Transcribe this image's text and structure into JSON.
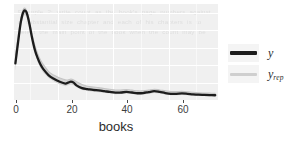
{
  "chart_data": {
    "type": "line",
    "title": "",
    "subtitle": "",
    "xlabel": "books",
    "ylabel": "",
    "xlim": [
      -0.5,
      73
    ],
    "ylim": [
      0,
      0.105
    ],
    "xticks": [
      0,
      20,
      40,
      60
    ],
    "xticklabels": [
      "0",
      "20",
      "40",
      "60"
    ],
    "yticks": [],
    "yticklabels": [],
    "grid": true,
    "grid_color": "#ffffff",
    "panel_background": "#f0f0f0",
    "legend_position": "right",
    "series": [
      {
        "name": "y",
        "label": "y",
        "color": "#1c1c1c",
        "linewidth": 2.2,
        "x": [
          0,
          1,
          2,
          3,
          4,
          5,
          6,
          7,
          8,
          9,
          10,
          12,
          14,
          16,
          18,
          19,
          20,
          21,
          22,
          24,
          26,
          28,
          30,
          32,
          34,
          36,
          38,
          40,
          42,
          44,
          46,
          48,
          50,
          52,
          54,
          56,
          58,
          60,
          62,
          64,
          66,
          68,
          70,
          72
        ],
        "values": [
          0.04,
          0.064,
          0.086,
          0.097,
          0.096,
          0.084,
          0.068,
          0.055,
          0.046,
          0.039,
          0.034,
          0.027,
          0.023,
          0.02,
          0.018,
          0.019,
          0.02,
          0.019,
          0.016,
          0.013,
          0.012,
          0.011,
          0.0105,
          0.0097,
          0.0088,
          0.008,
          0.0082,
          0.0088,
          0.0082,
          0.0074,
          0.0076,
          0.0086,
          0.0096,
          0.0088,
          0.0076,
          0.0068,
          0.0068,
          0.0072,
          0.0068,
          0.0062,
          0.0058,
          0.0056,
          0.0054,
          0.0052
        ]
      },
      {
        "name": "y_rep",
        "label": "y",
        "label_sub": "rep",
        "color": "#cfcfcf",
        "linewidth": 1.0,
        "description": "posterior predictive replications (light gray band)",
        "band_upper": [
          0.049,
          0.07,
          0.09,
          0.1,
          0.098,
          0.087,
          0.072,
          0.06,
          0.051,
          0.044,
          0.039,
          0.031,
          0.027,
          0.024,
          0.022,
          0.022,
          0.023,
          0.022,
          0.02,
          0.017,
          0.015,
          0.0142,
          0.0135,
          0.0126,
          0.0118,
          0.011,
          0.011,
          0.0114,
          0.0108,
          0.01,
          0.01,
          0.0108,
          0.0118,
          0.011,
          0.01,
          0.0092,
          0.0092,
          0.0094,
          0.009,
          0.0084,
          0.008,
          0.0077,
          0.0075,
          0.0073
        ],
        "band_lower": [
          0.032,
          0.057,
          0.081,
          0.093,
          0.092,
          0.08,
          0.064,
          0.051,
          0.042,
          0.035,
          0.03,
          0.024,
          0.02,
          0.017,
          0.015,
          0.016,
          0.017,
          0.016,
          0.014,
          0.011,
          0.0098,
          0.009,
          0.0085,
          0.0078,
          0.007,
          0.0064,
          0.0065,
          0.007,
          0.0065,
          0.0058,
          0.006,
          0.0068,
          0.0077,
          0.007,
          0.006,
          0.0053,
          0.0053,
          0.0056,
          0.0053,
          0.0048,
          0.0045,
          0.0043,
          0.0041,
          0.004
        ]
      }
    ]
  },
  "axis": {
    "title": "books",
    "tick_labels": [
      "0",
      "20",
      "40",
      "60"
    ]
  },
  "legend": {
    "items": [
      {
        "label": "y",
        "sub": "",
        "swatch": "dark-line-swatch",
        "color": "#1c1c1c"
      },
      {
        "label": "y",
        "sub": "rep",
        "swatch": "light-line-swatch",
        "color": "#cfcfcf"
      }
    ]
  },
  "background_text": "Example 2: write count as the book's page numbers against a substantial size chapter and each of his chapters is to select the main point of the book when the count may be"
}
